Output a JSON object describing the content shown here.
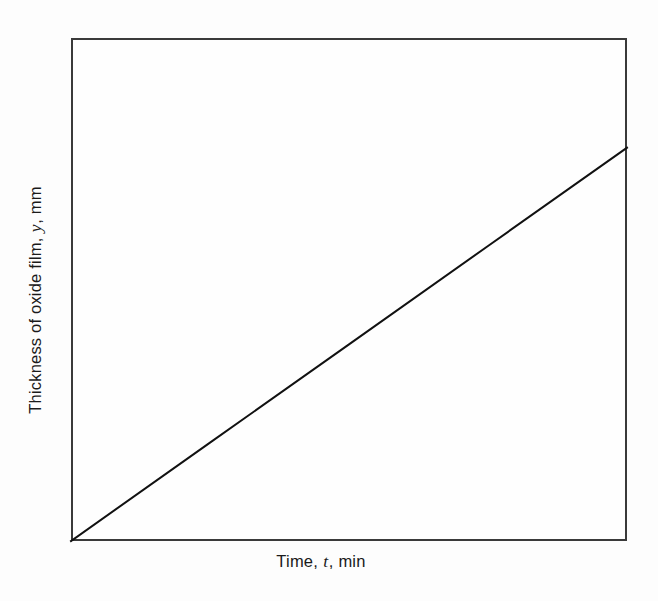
{
  "figure": {
    "background_color": "#fdfdfd",
    "frame_color": "#3a3a3a",
    "line_color": "#111111"
  },
  "axes": {
    "x_title_prefix": "Time,",
    "x_title_symbol": "t",
    "x_title_suffix": ", min",
    "x_title_full": "Time, t, min",
    "y_title_prefix": "Thickness of oxide film,",
    "y_title_symbol": "y",
    "y_title_suffix": ", mm",
    "y_title_full": "Thickness of oxide film, y, mm"
  },
  "chart_data": {
    "type": "line",
    "title": "",
    "subtitle": "",
    "xlabel": "Time, t, min",
    "ylabel": "Thickness of oxide film, y, mm",
    "grid": false,
    "legend": "none",
    "xticks": [],
    "yticks": [],
    "xticklabels": [],
    "yticklabels": [],
    "xlim": [
      0,
      1
    ],
    "ylim": [
      0,
      1
    ],
    "annotations": [],
    "series": [
      {
        "name": "linear oxidation",
        "style": "solid",
        "color": "#111111",
        "linewidth": 2,
        "x": [
          0,
          0.25,
          0.5,
          0.75,
          1
        ],
        "y": [
          0,
          0.1955,
          0.391,
          0.5865,
          0.782
        ],
        "description": "Straight line rising from the origin at the lower-left corner to the right-hand frame edge at about 78 percent of full scale height"
      }
    ]
  }
}
